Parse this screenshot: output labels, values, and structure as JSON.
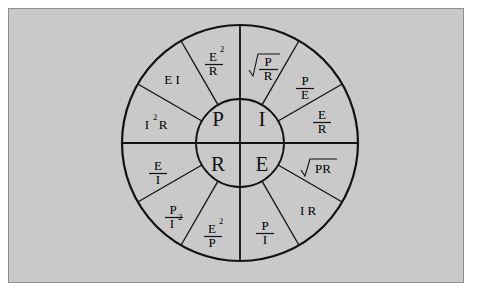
{
  "diagram": {
    "background_color": "#c9c9c9",
    "page_color": "#ffffff",
    "line_color": "#111111",
    "geometry": {
      "center_x": 240,
      "center_y": 143,
      "outer_radius": 118,
      "inner_radius": 44,
      "sector_count": 12,
      "sector_degrees": 30
    },
    "center_quadrants": [
      {
        "id": "power",
        "label": "P",
        "position": "top-left"
      },
      {
        "id": "current",
        "label": "I",
        "position": "top-right"
      },
      {
        "id": "resistance",
        "label": "R",
        "position": "bottom-left"
      },
      {
        "id": "voltage",
        "label": "E",
        "position": "bottom-right"
      }
    ],
    "sectors": [
      {
        "id": "sqrt-p-over-r",
        "kind": "sqrt-fraction",
        "numerator": "P",
        "denominator": "R",
        "start_deg": 0,
        "end_deg": 30
      },
      {
        "id": "p-over-e",
        "kind": "fraction",
        "numerator": "P",
        "denominator": "E",
        "start_deg": 30,
        "end_deg": 60
      },
      {
        "id": "e-over-r",
        "kind": "fraction",
        "numerator": "E",
        "denominator": "R",
        "start_deg": 60,
        "end_deg": 90
      },
      {
        "id": "sqrt-pr",
        "kind": "sqrt-plain",
        "text": "PR",
        "start_deg": 90,
        "end_deg": 120
      },
      {
        "id": "i-r",
        "kind": "plain",
        "text": "I R",
        "start_deg": 120,
        "end_deg": 150
      },
      {
        "id": "p-over-i",
        "kind": "fraction",
        "numerator": "P",
        "denominator": "I",
        "start_deg": 150,
        "end_deg": 180
      },
      {
        "id": "e2-over-p",
        "kind": "fraction",
        "numerator": "E",
        "numerator_sup": "2",
        "denominator": "P",
        "start_deg": 180,
        "end_deg": 210
      },
      {
        "id": "p-over-i2",
        "kind": "fraction",
        "numerator": "P",
        "denominator": "I",
        "denominator_sup": "2",
        "start_deg": 210,
        "end_deg": 240
      },
      {
        "id": "e-over-i",
        "kind": "fraction",
        "numerator": "E",
        "denominator": "I",
        "start_deg": 240,
        "end_deg": 270
      },
      {
        "id": "i2-r",
        "kind": "plain-sup",
        "base": "I",
        "sup": "2",
        "tail": "R",
        "start_deg": 270,
        "end_deg": 300
      },
      {
        "id": "e-i",
        "kind": "plain",
        "text": "E I",
        "start_deg": 300,
        "end_deg": 330
      },
      {
        "id": "e2-over-r",
        "kind": "fraction",
        "numerator": "E",
        "numerator_sup": "2",
        "denominator": "R",
        "start_deg": 330,
        "end_deg": 360
      }
    ]
  }
}
